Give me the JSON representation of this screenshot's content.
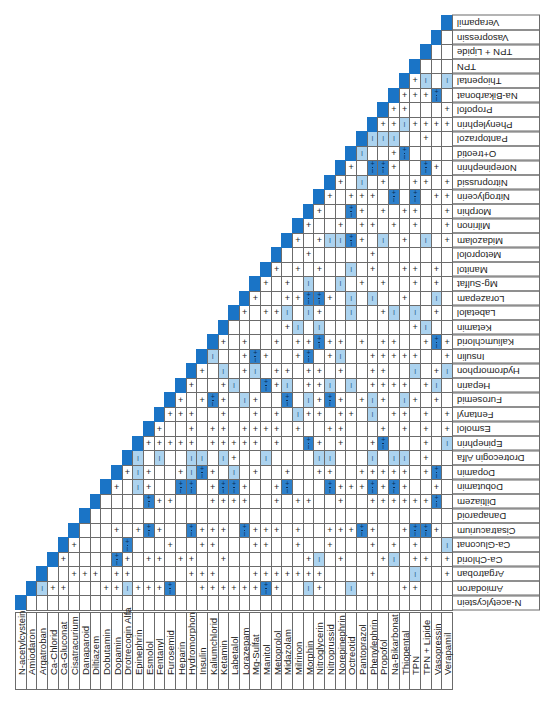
{
  "colors": {
    "diagonal": "#1a74c6",
    "incompatible": "#acd3ef",
    "variable": "#2d80cb",
    "grid": "#6b6b6b"
  },
  "legend": {
    "compatible_symbol": "+",
    "incompatible_symbol": "I",
    "variable_symbol": "+/I"
  },
  "drugs": [
    "N-acetylcystein",
    "Amiodaron",
    "Argatroban",
    "Ca-Chlorid",
    "Ca-Gluconat",
    "Cisatracurium",
    "Danaparoid",
    "Diltiazem",
    "Dobutamin",
    "Dopamin",
    "Drotrecogin Alfa",
    "Epinephrin",
    "Esmolol",
    "Fentanyl",
    "Furosemid",
    "Heparin",
    "Hydromorphon",
    "Insulin",
    "Kaliumchlorid",
    "Ketamin",
    "Labetalol",
    "Lorazepam",
    "Mg-Sulfat",
    "Manitol",
    "Metoprolol",
    "Midazolam",
    "Milrinon",
    "Morphin",
    "Nitroglycerin",
    "Nitroprussid",
    "Norepinephrin",
    "O+treotid",
    "Pantoprazol",
    "Phenylephrin",
    "Propofol",
    "Na-Bikarbonat",
    "Thiopental",
    "TPN",
    "TPN + Lipide",
    "Vasopressin",
    "Verapamil"
  ],
  "column_labels": [
    "N-acetylcystein",
    "Amiodaron",
    "Argatroban",
    "Ca-Chlorid",
    "Ca-Gluconat",
    "Cisatracurium",
    "Danaparoid",
    "Diltiazem",
    "Dobutamin",
    "Dopamin",
    "Drotrecogin Alfa",
    "Epinephrin",
    "Esmolol",
    "Fentanyl",
    "Furosemid",
    "Heparin",
    "Hydromorphon",
    "Insulin",
    "Kaliumchlorid",
    "Ketamin",
    "Labetalol",
    "Lorazepam",
    "Mg-Sulfat",
    "Manitol",
    "Metoprolol",
    "Midazolam",
    "Milrinon",
    "Morphin",
    "Nitroglycerin",
    "Nitroprussid",
    "Norepinephrin",
    "Octreotid",
    "Pantoprazol",
    "Phenylephrin",
    "Propofol",
    "Na-Bikarbonat",
    "Thiopental",
    "TPN",
    "TPN + Lipide",
    "Vasopressin",
    "Verapamil"
  ],
  "rows_note": "Each row string covers columns i+1..40; '.'=empty, '+'=compatible, 'I'=incompatible, 'X'=+/I variable",
  "rows": [
    "........................................",
    "I++...++I+++X..++++++X+..I+..I....++",
    "..+++.++.....+++...+++++++....+...I..++",
    "+....X+.++.++..+.......+I.+...+I.++.+",
    "+....X...+..++...++..+..+...+.+.+..I..+.+",
    "...+.+X+..X+++.X+++.+..+++X+..+XX+..",
    "...................................",
    "....X++...++++..+.++..+..++++++X..+..I.",
    "+.I+..XX.+XX+..+X...X+++X+X+..+..I..",
    "+I+..+IX+.I.+..+..++..+++++.+X...+III++",
    "I.I..II.I+..I....II...I.II.+.....+",
    "+++++.+++++.+..X+.+..+X...+.I..++",
    "+..+.++.++++.+..++...+.+.+.++.+",
    "+++..+..+.+.I++.++.I.++.+.+.+",
    "+.+X+.I+..X.I+X+.+I+.I+.+.I.+",
    "+..+I..X+I.++I.I.++++.+I.I++",
    "+.I.+I.++.++.+..++..I.+I.I+",
    "I..+X+..+X.+I..+++++..+.+",
    "+.+..+.++X++.+.++..+X+.+",
    ".....+I.I........+I...",
    "+.++I.I+..I..+I.I.+..",
    "+..++XX+.I.I..+..I..",
    "+.+.I..I.+.+..+.+.+",
    "+.+.+..I.+..++.+.",
    "..+.....+........",
    "+.+IIX+.I.+.I.+.",
    "+..+.++.+.+..++",
    "+..X+.+.++..+",
    "+.+++.X.X.+++",
    "+.I.+..++.+",
    "+.XX+..X+.++",
    "I..+X.....",
    "III..+....",
    "++I++++...",
    "++...+....",
    "+++X.....",
    "+I.I.",
    "....",
    "...",
    "..",
    ""
  ],
  "footer": ""
}
